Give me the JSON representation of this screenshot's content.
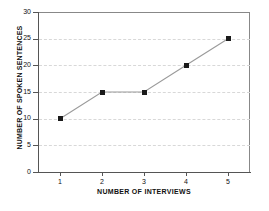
{
  "chart_data": {
    "type": "line",
    "title": "",
    "xlabel": "NUMBER OF INTERVIEWS",
    "ylabel": "NUMBER OF SPOKEN SENTENCES",
    "x": [
      1,
      2,
      3,
      4,
      5
    ],
    "values": [
      10,
      15,
      15,
      20,
      25
    ],
    "categories": [
      "1",
      "2",
      "3",
      "4",
      "5"
    ],
    "xtick_labels": [
      "1",
      "2",
      "3",
      "4",
      "5"
    ],
    "ytick_labels": [
      "0",
      "5",
      "10",
      "15",
      "20",
      "25",
      "30"
    ],
    "ytick_values": [
      0,
      5,
      10,
      15,
      20,
      25,
      30
    ],
    "xlim": [
      0.5,
      5.6
    ],
    "ylim": [
      0,
      30
    ],
    "grid": true,
    "grid_axis": "y",
    "legend": false,
    "legend_position": "none",
    "marker": "square",
    "line_color": "#9a9a9a",
    "marker_color": "#1a1a1a",
    "grid_color": "#d8d8d8",
    "axis_color": "#555555",
    "background_color": "#ffffff",
    "series": [
      {
        "name": "NUMBER OF SPOKEN SENTENCES",
        "values": [
          10,
          15,
          15,
          20,
          25
        ]
      }
    ],
    "points": [
      {
        "x": 1,
        "y": 10
      },
      {
        "x": 2,
        "y": 15
      },
      {
        "x": 3,
        "y": 15
      },
      {
        "x": 4,
        "y": 20
      },
      {
        "x": 5,
        "y": 25
      }
    ]
  }
}
